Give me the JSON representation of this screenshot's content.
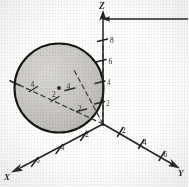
{
  "figure": {
    "background_color": "#fdfdfc",
    "ink_color": "#2a2927",
    "sphere_fill_color": "#c9c7c3",
    "sphere_edge_color": "#1a1918"
  },
  "axes": {
    "z": {
      "label": "Z",
      "ticks": [
        {
          "label": "8"
        },
        {
          "label": "6"
        },
        {
          "label": "4"
        },
        {
          "label": "2"
        }
      ]
    },
    "y": {
      "label": "Y",
      "ticks": [
        {
          "label": "2"
        },
        {
          "label": "4"
        },
        {
          "label": "6"
        }
      ]
    },
    "x": {
      "label": "X",
      "ticks": [
        {
          "label": "2"
        },
        {
          "label": "4"
        },
        {
          "label": "6"
        }
      ]
    },
    "hidden_x": {
      "ticks": [
        {
          "label": "4"
        },
        {
          "label": "2"
        }
      ]
    },
    "hidden_y": {
      "ticks": [
        {
          "label": "2"
        },
        {
          "label": "4"
        }
      ]
    }
  },
  "sphere": {
    "center_marker": "center-dot",
    "shading": "stippled-gray"
  }
}
